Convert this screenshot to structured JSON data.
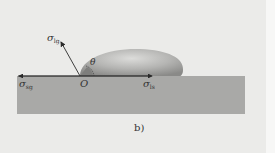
{
  "figure": {
    "caption": "b)",
    "labels": {
      "sigma_lg": {
        "symbol": "σ",
        "subscript": "lg"
      },
      "sigma_sg": {
        "symbol": "σ",
        "subscript": "sg"
      },
      "sigma_ls": {
        "symbol": "σ",
        "subscript": "ls"
      },
      "theta": "θ",
      "origin": "O"
    },
    "colors": {
      "background": "#ebebe9",
      "substrate": "#a9a9a7",
      "droplet_light": "#d6d6d4",
      "droplet_dark": "#8f8f8d",
      "vector": "#2a2a2a"
    }
  }
}
